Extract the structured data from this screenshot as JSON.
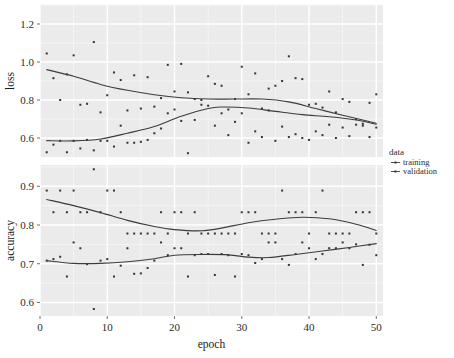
{
  "chart_data": {
    "type": "scatter",
    "title": "",
    "xlabel": "epoch",
    "xlim": [
      0,
      51
    ],
    "xticks": [
      0,
      10,
      20,
      30,
      40,
      50
    ],
    "grid": true,
    "legend": {
      "title": "data",
      "position": "right",
      "entries": [
        {
          "label": "training",
          "glyph": "line-point"
        },
        {
          "label": "validation",
          "glyph": "line-point"
        }
      ]
    },
    "facets": [
      {
        "name": "loss",
        "ylabel": "loss",
        "ylim": [
          0.5,
          1.3
        ],
        "yticks": [
          0.6,
          0.8,
          1.0,
          1.2
        ],
        "ytick_labels": [
          "0.6",
          "0.8",
          "1.0",
          "1.2"
        ],
        "series": [
          {
            "name": "training",
            "x": [
              1,
              2,
              3,
              4,
              5,
              6,
              7,
              8,
              9,
              10,
              11,
              12,
              13,
              14,
              15,
              16,
              17,
              18,
              19,
              20,
              21,
              22,
              23,
              24,
              25,
              26,
              27,
              28,
              29,
              30,
              31,
              32,
              33,
              34,
              35,
              36,
              37,
              38,
              39,
              40,
              41,
              42,
              43,
              44,
              45,
              46,
              47,
              48,
              49,
              50
            ],
            "y": [
              1.045,
              0.915,
              0.8,
              0.935,
              1.035,
              0.775,
              0.78,
              1.105,
              0.735,
              0.825,
              0.945,
              0.905,
              0.745,
              0.93,
              0.755,
              0.92,
              0.765,
              0.81,
              0.985,
              0.845,
              0.99,
              0.84,
              0.805,
              0.8,
              0.925,
              0.885,
              0.875,
              0.75,
              0.805,
              0.975,
              0.83,
              0.94,
              0.755,
              0.86,
              0.875,
              0.9,
              1.03,
              0.915,
              0.91,
              0.775,
              0.78,
              0.76,
              0.845,
              0.735,
              0.805,
              0.79,
              0.7,
              0.665,
              0.785,
              0.83
            ],
            "smooth": [
              [
                1,
                0.96
              ],
              [
                5,
                0.925
              ],
              [
                9,
                0.882
              ],
              [
                13,
                0.851
              ],
              [
                17,
                0.828
              ],
              [
                21,
                0.812
              ],
              [
                25,
                0.805
              ],
              [
                29,
                0.805
              ],
              [
                33,
                0.805
              ],
              [
                37,
                0.79
              ],
              [
                41,
                0.755
              ],
              [
                45,
                0.72
              ],
              [
                48,
                0.695
              ],
              [
                50,
                0.678
              ]
            ]
          },
          {
            "name": "validation",
            "x": [
              1,
              2,
              3,
              4,
              5,
              6,
              7,
              8,
              9,
              10,
              11,
              12,
              13,
              14,
              15,
              16,
              17,
              18,
              19,
              20,
              21,
              22,
              23,
              24,
              25,
              26,
              27,
              28,
              29,
              30,
              31,
              32,
              33,
              34,
              35,
              36,
              37,
              38,
              39,
              40,
              41,
              42,
              43,
              44,
              45,
              46,
              47,
              48,
              49,
              50
            ],
            "y": [
              0.525,
              0.565,
              0.585,
              0.525,
              0.585,
              0.545,
              0.59,
              0.535,
              0.585,
              0.585,
              0.555,
              0.665,
              0.575,
              0.575,
              0.58,
              0.59,
              0.625,
              0.65,
              0.73,
              0.75,
              0.69,
              0.52,
              0.695,
              0.775,
              0.77,
              0.665,
              0.73,
              0.615,
              0.685,
              0.73,
              0.575,
              0.635,
              0.605,
              0.745,
              0.585,
              0.66,
              0.605,
              0.62,
              0.6,
              0.59,
              0.635,
              0.615,
              0.67,
              0.6,
              0.655,
              0.61,
              0.67,
              0.675,
              0.605,
              0.655
            ],
            "smooth": [
              [
                1,
                0.586
              ],
              [
                5,
                0.585
              ],
              [
                9,
                0.595
              ],
              [
                13,
                0.625
              ],
              [
                17,
                0.66
              ],
              [
                21,
                0.715
              ],
              [
                25,
                0.755
              ],
              [
                27,
                0.763
              ],
              [
                31,
                0.758
              ],
              [
                35,
                0.74
              ],
              [
                39,
                0.723
              ],
              [
                43,
                0.712
              ],
              [
                47,
                0.695
              ],
              [
                50,
                0.672
              ]
            ]
          }
        ]
      },
      {
        "name": "accuracy",
        "ylabel": "accuracy",
        "ylim": [
          0.565,
          0.955
        ],
        "yticks": [
          0.6,
          0.7,
          0.8,
          0.9
        ],
        "ytick_labels": [
          "0.6",
          "0.7",
          "0.8",
          "0.9"
        ],
        "series": [
          {
            "name": "training",
            "x": [
              1,
              2,
              3,
              4,
              5,
              6,
              7,
              8,
              9,
              10,
              11,
              12,
              13,
              14,
              15,
              16,
              17,
              18,
              19,
              20,
              21,
              22,
              23,
              24,
              25,
              26,
              27,
              28,
              29,
              30,
              31,
              32,
              33,
              34,
              35,
              36,
              37,
              38,
              39,
              40,
              41,
              42,
              43,
              44,
              45,
              46,
              47,
              48,
              49,
              50
            ],
            "y": [
              0.889,
              0.833,
              0.889,
              0.833,
              0.889,
              0.833,
              0.833,
              0.944,
              0.833,
              0.889,
              0.889,
              0.833,
              0.778,
              0.778,
              0.778,
              0.778,
              0.778,
              0.833,
              0.778,
              0.833,
              0.833,
              0.778,
              0.833,
              0.778,
              0.778,
              0.778,
              0.778,
              0.778,
              0.778,
              0.833,
              0.833,
              0.833,
              0.778,
              0.778,
              0.778,
              0.889,
              0.833,
              0.833,
              0.833,
              0.778,
              0.833,
              0.889,
              0.778,
              0.778,
              0.778,
              0.778,
              0.833,
              0.833,
              0.833,
              0.778
            ],
            "smooth": [
              [
                1,
                0.866
              ],
              [
                5,
                0.85
              ],
              [
                9,
                0.832
              ],
              [
                13,
                0.812
              ],
              [
                17,
                0.796
              ],
              [
                20,
                0.788
              ],
              [
                24,
                0.785
              ],
              [
                27,
                0.792
              ],
              [
                31,
                0.806
              ],
              [
                35,
                0.815
              ],
              [
                39,
                0.82
              ],
              [
                43,
                0.816
              ],
              [
                47,
                0.802
              ],
              [
                50,
                0.786
              ]
            ]
          },
          {
            "name": "validation",
            "x": [
              1,
              2,
              3,
              4,
              5,
              6,
              7,
              8,
              9,
              10,
              11,
              12,
              13,
              14,
              15,
              16,
              17,
              18,
              19,
              20,
              21,
              22,
              23,
              24,
              25,
              26,
              27,
              28,
              29,
              30,
              31,
              32,
              33,
              34,
              35,
              36,
              37,
              38,
              39,
              40,
              41,
              42,
              43,
              44,
              45,
              46,
              47,
              48,
              49,
              50
            ],
            "y": [
              0.708,
              0.712,
              0.718,
              0.667,
              0.755,
              0.74,
              0.699,
              0.583,
              0.708,
              0.712,
              0.667,
              0.695,
              0.74,
              0.674,
              0.675,
              0.689,
              0.708,
              0.755,
              0.722,
              0.74,
              0.74,
              0.667,
              0.722,
              0.725,
              0.725,
              0.671,
              0.725,
              0.722,
              0.667,
              0.725,
              0.722,
              0.702,
              0.712,
              0.755,
              0.755,
              0.712,
              0.697,
              0.725,
              0.755,
              0.74,
              0.712,
              0.725,
              0.74,
              0.74,
              0.755,
              0.74,
              0.75,
              0.697,
              0.749,
              0.722
            ],
            "smooth": [
              [
                1,
                0.708
              ],
              [
                5,
                0.701
              ],
              [
                9,
                0.701
              ],
              [
                13,
                0.705
              ],
              [
                17,
                0.713
              ],
              [
                20,
                0.722
              ],
              [
                24,
                0.724
              ],
              [
                28,
                0.723
              ],
              [
                31,
                0.717
              ],
              [
                34,
                0.716
              ],
              [
                38,
                0.724
              ],
              [
                42,
                0.733
              ],
              [
                46,
                0.742
              ],
              [
                50,
                0.752
              ]
            ]
          }
        ]
      }
    ],
    "style": {
      "panel_bg": "#ebebeb",
      "grid_major": "#ffffff",
      "grid_minor": "#f7f7f7",
      "point_color": "#333333",
      "line_color": "#3c3c3c",
      "plot_bg": "#ffffff"
    }
  }
}
